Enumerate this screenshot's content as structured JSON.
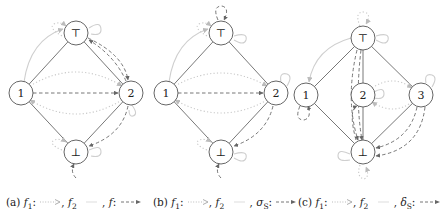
{
  "figure": {
    "panels": [
      {
        "id": "a",
        "caption_label": "(a)",
        "legend": [
          {
            "symbol": "f",
            "sub": "1",
            "style": "dotted-light"
          },
          {
            "symbol": "f",
            "sub": "2",
            "style": "solid-light"
          },
          {
            "symbol": "f",
            "sub": "",
            "style": "dashed-dark"
          }
        ],
        "nodes": [
          {
            "id": "top",
            "label": "⊤"
          },
          {
            "id": "1",
            "label": "1"
          },
          {
            "id": "2",
            "label": "2"
          },
          {
            "id": "bot",
            "label": "⊥"
          }
        ]
      },
      {
        "id": "b",
        "caption_label": "(b)",
        "legend": [
          {
            "symbol": "f",
            "sub": "1",
            "style": "dotted-light"
          },
          {
            "symbol": "f",
            "sub": "2",
            "style": "solid-light"
          },
          {
            "symbol": "σ",
            "sub": "S",
            "style": "dashed-dark"
          }
        ],
        "nodes": [
          {
            "id": "top",
            "label": "⊤"
          },
          {
            "id": "1",
            "label": "1"
          },
          {
            "id": "2",
            "label": "2"
          },
          {
            "id": "bot",
            "label": "⊥"
          }
        ]
      },
      {
        "id": "c",
        "caption_label": "(c)",
        "legend": [
          {
            "symbol": "f",
            "sub": "1",
            "style": "dotted-light"
          },
          {
            "symbol": "f",
            "sub": "2",
            "style": "solid-light"
          },
          {
            "symbol": "δ",
            "sub": "S",
            "style": "dashed-dark"
          }
        ],
        "nodes": [
          {
            "id": "top",
            "label": "⊤"
          },
          {
            "id": "1",
            "label": "1"
          },
          {
            "id": "2",
            "label": "2"
          },
          {
            "id": "3",
            "label": "3"
          },
          {
            "id": "bot",
            "label": "⊥"
          }
        ]
      }
    ]
  }
}
